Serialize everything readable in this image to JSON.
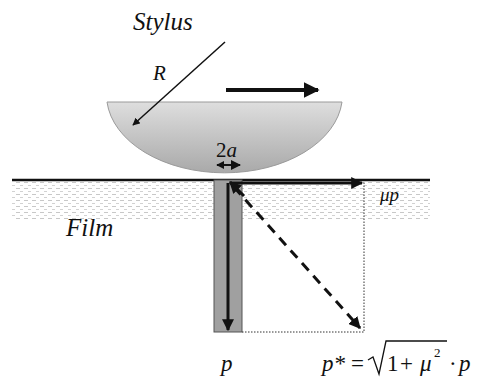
{
  "labels": {
    "stylus": "Stylus",
    "radius": "R",
    "contact_width_num": "2",
    "contact_width_var": "a",
    "film": "Film",
    "friction_force": "μp",
    "normal_pressure": "p",
    "formula": {
      "lhs": "p*",
      "equals": "=",
      "radicand_one": "1",
      "plus": "+",
      "mu": "μ",
      "exponent": "2",
      "dot": "·",
      "rhs_var": "p"
    }
  },
  "colors": {
    "stylus_fill_light": "#dedede",
    "stylus_fill_dark": "#a9a9a9",
    "column_fill": "#a0a0a0",
    "film_dots": "#bdbdbd",
    "stroke": "#111111"
  }
}
